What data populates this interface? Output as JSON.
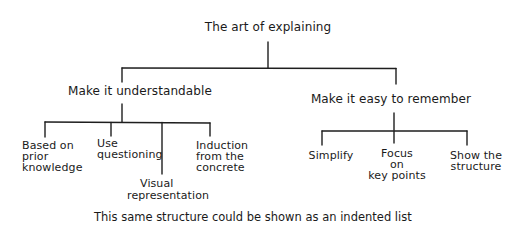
{
  "diagram": {
    "root": {
      "label": "The art of explaining"
    },
    "branches": [
      {
        "label": "Make it understandable",
        "children": [
          {
            "lines": [
              "Based on",
              "prior",
              "knowledge"
            ]
          },
          {
            "lines": [
              "Use",
              "questioning"
            ]
          },
          {
            "lines": [
              "Visual",
              "representation"
            ]
          },
          {
            "lines": [
              "Induction",
              "from the",
              "concrete"
            ]
          }
        ]
      },
      {
        "label": "Make it easy to remember",
        "children": [
          {
            "lines": [
              "Simplify"
            ]
          },
          {
            "lines": [
              "Focus",
              "on",
              "key points"
            ]
          },
          {
            "lines": [
              "Show the",
              "structure"
            ]
          }
        ]
      }
    ],
    "caption": "This same structure could be shown as an indented list",
    "line_color": "#1e1e1e"
  }
}
